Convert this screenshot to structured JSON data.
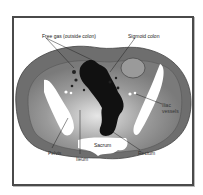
{
  "diagram": {
    "title": "",
    "labels": {
      "free_gas": "Free gas (outside colon)",
      "sigmoid": "Sigmoid colon",
      "iliac_vessels_line1": "Iliac",
      "iliac_vessels_line2": "vessels",
      "sacrum": "Sacrum",
      "pelvis": "Pelvis",
      "ileum": "Ileum",
      "rectum": "Rectum"
    },
    "colors": {
      "body_outer": "#6e6e6e",
      "body_inner": "#8a8a8a",
      "bone": "#ffffff",
      "gas_colon": "#111111",
      "frame": "#4a4a4a"
    }
  }
}
